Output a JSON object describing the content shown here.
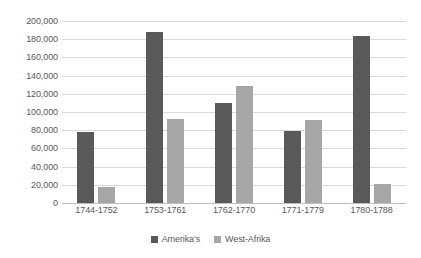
{
  "chart_data": {
    "type": "bar",
    "title": "",
    "xlabel": "",
    "ylabel": "",
    "categories": [
      "1744-1752",
      "1753-1761",
      "1762-1770",
      "1771-1779",
      "1780-1788"
    ],
    "series": [
      {
        "name": "Amerika's",
        "color": "#595959",
        "values": [
          78000,
          188000,
          110000,
          79000,
          183000
        ]
      },
      {
        "name": "West-Afrika",
        "color": "#a6a6a6",
        "values": [
          18000,
          92000,
          129000,
          91000,
          20500
        ]
      }
    ],
    "ylim": [
      0,
      200000
    ],
    "ytick_step": 20000,
    "ytick_labels": [
      "200,000",
      "180,000",
      "160,000",
      "140,000",
      "120,000",
      "100,000",
      "80,000",
      "60,000",
      "40,000",
      "20,000",
      "0"
    ],
    "ytick_values": [
      200000,
      180000,
      160000,
      140000,
      120000,
      100000,
      80000,
      60000,
      40000,
      20000,
      0
    ],
    "grid": "horizontal",
    "legend_position": "bottom-center",
    "plot_background": "#ffffff",
    "gridline_color": "#d9d9d9",
    "axis_color": "#bfbfbf",
    "text_color": "#595959"
  }
}
